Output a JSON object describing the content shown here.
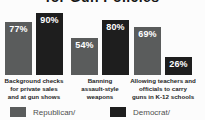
{
  "title": {
    "visible_fragment": "for Gun Policies",
    "note": "title clipped at top edge of screenshot"
  },
  "chart_data": {
    "type": "bar",
    "categories": [
      {
        "lines": [
          "Background checks",
          "for private sales",
          "and at gun shows"
        ]
      },
      {
        "lines": [
          "Banning",
          "assault-style",
          "weapons"
        ]
      },
      {
        "lines": [
          "Allowing teachers and",
          "officials to carry",
          "guns in K-12 schools"
        ]
      }
    ],
    "series": [
      {
        "name": "Republican/",
        "color": "#5a5c5c",
        "values": [
          77,
          54,
          69
        ],
        "value_labels": [
          "77%",
          "90%",
          "54%",
          "80%",
          "69%",
          "26%"
        ]
      },
      {
        "name": "Democrat/",
        "color": "#1e1e1e",
        "values": [
          90,
          80,
          26
        ]
      }
    ],
    "value_label_format": "percent",
    "ylim": [
      0,
      100
    ],
    "grid": false,
    "legend_position": "bottom",
    "value_labels_republican": [
      "77%",
      "54%",
      "69%"
    ],
    "value_labels_democrat": [
      "90%",
      "80%",
      "26%"
    ]
  },
  "legend": {
    "items": [
      {
        "label": "Republican/",
        "color": "#5a5c5c"
      },
      {
        "label": "Democrat/",
        "color": "#1e1e1e"
      }
    ]
  },
  "colors": {
    "background": "#fcfcfc",
    "republican_bar": "#5a5c5c",
    "democrat_bar": "#1e1e1e",
    "bar_value_text": "#ffffff",
    "category_text": "#262626",
    "legend_text": "#4f4f4f",
    "title_text": "#161616"
  }
}
